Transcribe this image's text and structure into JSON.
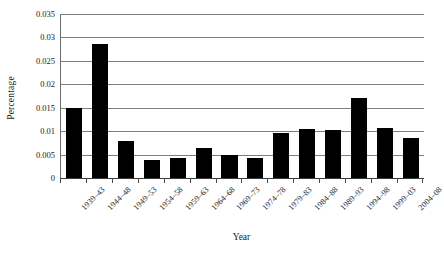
{
  "chart_data": {
    "type": "bar",
    "title": "",
    "xlabel": "Year",
    "ylabel": "Percentage",
    "categories": [
      "1939–43",
      "1944–48",
      "1949–53",
      "1954–58",
      "1959–63",
      "1964–68",
      "1969–73",
      "1974–78",
      "1979–83",
      "1984–88",
      "1989–93",
      "1994–98",
      "1999–03",
      "2004–08"
    ],
    "values": [
      0.015,
      0.0287,
      0.008,
      0.0038,
      0.0043,
      0.0063,
      0.005,
      0.0042,
      0.0097,
      0.0105,
      0.0102,
      0.017,
      0.0107,
      0.0085
    ],
    "ylim": [
      0,
      0.035
    ],
    "ytick_values": [
      0,
      0.005,
      0.01,
      0.015,
      0.02,
      0.025,
      0.03,
      0.035
    ],
    "ytick_labels": [
      "0",
      "0.005",
      "0.01",
      "0.015",
      "0.02",
      "0.025",
      "0.03",
      "0.035"
    ],
    "grid": "horizontal",
    "legend": "none",
    "bar_color": "#000000",
    "gridline_color": "#7d7d7d",
    "axis_color": "#3a3a3a",
    "background_color": "#ffffff",
    "xtick_label_rotation": -45
  }
}
